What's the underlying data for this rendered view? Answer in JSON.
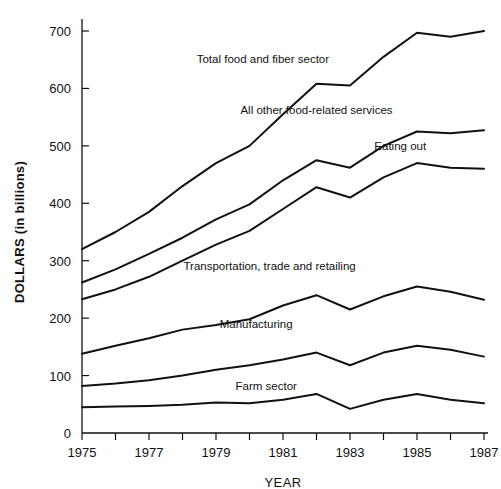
{
  "chart_data": {
    "type": "line",
    "title": "",
    "xlabel": "YEAR",
    "ylabel": "DOLLARS (in billions)",
    "xlim": [
      1975,
      1987
    ],
    "ylim": [
      0,
      730
    ],
    "grid": false,
    "legend": "inline-labels",
    "x": [
      1975,
      1976,
      1977,
      1978,
      1979,
      1980,
      1981,
      1982,
      1983,
      1984,
      1985,
      1986,
      1987
    ],
    "x_tick_labels": [
      "1975",
      "",
      "1977",
      "",
      "1979",
      "",
      "1981",
      "",
      "1983",
      "",
      "1985",
      "",
      "1987"
    ],
    "y_ticks": [
      0,
      100,
      200,
      300,
      400,
      500,
      600,
      700
    ],
    "y_tick_labels": [
      "0",
      "100",
      "200",
      "300",
      "400",
      "500",
      "600",
      "700"
    ],
    "series": [
      {
        "name": "Total food and fiber sector",
        "label": "Total food and fiber sector",
        "values": [
          320,
          350,
          385,
          430,
          470,
          500,
          555,
          608,
          605,
          655,
          697,
          690,
          700
        ]
      },
      {
        "name": "All other food-related services",
        "label": "All other food-related services",
        "values": [
          262,
          285,
          312,
          340,
          372,
          398,
          440,
          475,
          462,
          500,
          525,
          522,
          527
        ]
      },
      {
        "name": "Eating out",
        "label": "Eating out",
        "values": [
          233,
          250,
          272,
          300,
          328,
          352,
          390,
          428,
          410,
          445,
          470,
          462,
          460
        ]
      },
      {
        "name": "Transportation, trade and retailing",
        "label": "Transportation, trade and retailing",
        "values": [
          138,
          152,
          165,
          180,
          188,
          198,
          222,
          240,
          215,
          238,
          255,
          246,
          232
        ]
      },
      {
        "name": "Manufacturing",
        "label": "Manufacturing",
        "values": [
          82,
          86,
          92,
          100,
          110,
          118,
          128,
          140,
          118,
          140,
          152,
          145,
          133
        ]
      },
      {
        "name": "Farm sector",
        "label": "Farm sector",
        "values": [
          45,
          46,
          47,
          49,
          53,
          52,
          58,
          68,
          42,
          58,
          68,
          58,
          52
        ]
      }
    ],
    "series_label_positions": [
      {
        "x": 1980.4,
        "y": 645
      },
      {
        "x": 1982.0,
        "y": 555
      },
      {
        "x": 1984.5,
        "y": 492
      },
      {
        "x": 1980.6,
        "y": 283
      },
      {
        "x": 1980.2,
        "y": 182
      },
      {
        "x": 1980.5,
        "y": 75
      }
    ]
  }
}
